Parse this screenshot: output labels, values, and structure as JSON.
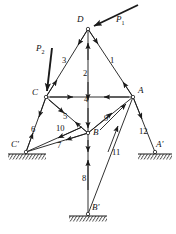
{
  "figure": {
    "type": "truss-free-body-diagram",
    "background_color": "#ffffff",
    "line_color": "#1a1a1a",
    "width": 176,
    "height": 234
  },
  "joints": [
    {
      "id": "D",
      "label": "D",
      "x": 88,
      "y": 29,
      "label_x": 77,
      "label_y": 20
    },
    {
      "id": "C",
      "label": "C",
      "x": 46,
      "y": 97,
      "label_x": 33,
      "label_y": 92
    },
    {
      "id": "A",
      "label": "A",
      "x": 133,
      "y": 97,
      "label_x": 138,
      "label_y": 90
    },
    {
      "id": "B",
      "label": "B",
      "x": 88,
      "y": 133,
      "label_x": 93,
      "label_y": 131
    },
    {
      "id": "Cp",
      "label": "C'",
      "x": 26,
      "y": 152,
      "label_x": 12,
      "label_y": 143
    },
    {
      "id": "Ap",
      "label": "A'",
      "x": 155,
      "y": 152,
      "label_x": 156,
      "label_y": 143
    },
    {
      "id": "Bp",
      "label": "B'",
      "x": 88,
      "y": 214,
      "label_x": 92,
      "label_y": 205
    }
  ],
  "members": [
    {
      "number": "1",
      "from": "D",
      "to": "A",
      "label_x": 110,
      "label_y": 60,
      "dashed": false
    },
    {
      "number": "2",
      "from": "D",
      "to": "B",
      "label_x": 83,
      "label_y": 73,
      "dashed": false
    },
    {
      "number": "3",
      "from": "D",
      "to": "C",
      "label_x": 64,
      "label_y": 60,
      "dashed": false
    },
    {
      "number": "4",
      "from": "C",
      "to": "A",
      "label_x": 84,
      "label_y": 99,
      "dashed": false
    },
    {
      "number": "5",
      "from": "C",
      "to": "B",
      "label_x": 64,
      "label_y": 116,
      "dashed": false
    },
    {
      "number": "6",
      "from": "C",
      "to": "Cp",
      "label_x": 33,
      "label_y": 129,
      "dashed": false
    },
    {
      "number": "7",
      "from": "Cp",
      "to": "B",
      "label_x": 58,
      "label_y": 145,
      "dashed": false
    },
    {
      "number": "8",
      "from": "B",
      "to": "Bp",
      "label_x": 82,
      "label_y": 178,
      "dashed": false
    },
    {
      "number": "9",
      "from": "B",
      "to": "A",
      "label_x": 104,
      "label_y": 118,
      "dashed": false
    },
    {
      "number": "10",
      "from": "Cp",
      "to": "B",
      "label_x": 60,
      "label_y": 128,
      "dashed": false
    },
    {
      "number": "11",
      "from": "A",
      "to": "Bp",
      "label_x": 113,
      "label_y": 152,
      "dashed": false
    },
    {
      "number": "12",
      "from": "A",
      "to": "Ap",
      "label_x": 141,
      "label_y": 131,
      "dashed": false
    }
  ],
  "loads": [
    {
      "id": "P1",
      "label": "P",
      "subscript": "1",
      "label_x": 117,
      "label_y": 20,
      "from_x": 138,
      "from_y": 5,
      "to_x": 92,
      "to_y": 27,
      "applied_at": "D"
    },
    {
      "id": "P2",
      "label": "P",
      "subscript": "2",
      "label_x": 37,
      "label_y": 48,
      "from_x": 52,
      "from_y": 48,
      "to_x": 47,
      "to_y": 93,
      "applied_at": "C"
    }
  ],
  "supports": [
    {
      "id": "support-C-prime",
      "x": 26,
      "y": 152,
      "width": 38,
      "hatch": "ground"
    },
    {
      "id": "support-A-prime",
      "x": 155,
      "y": 152,
      "width": 34,
      "hatch": "ground"
    },
    {
      "id": "support-B-prime",
      "x": 88,
      "y": 214,
      "width": 38,
      "hatch": "ground"
    }
  ]
}
